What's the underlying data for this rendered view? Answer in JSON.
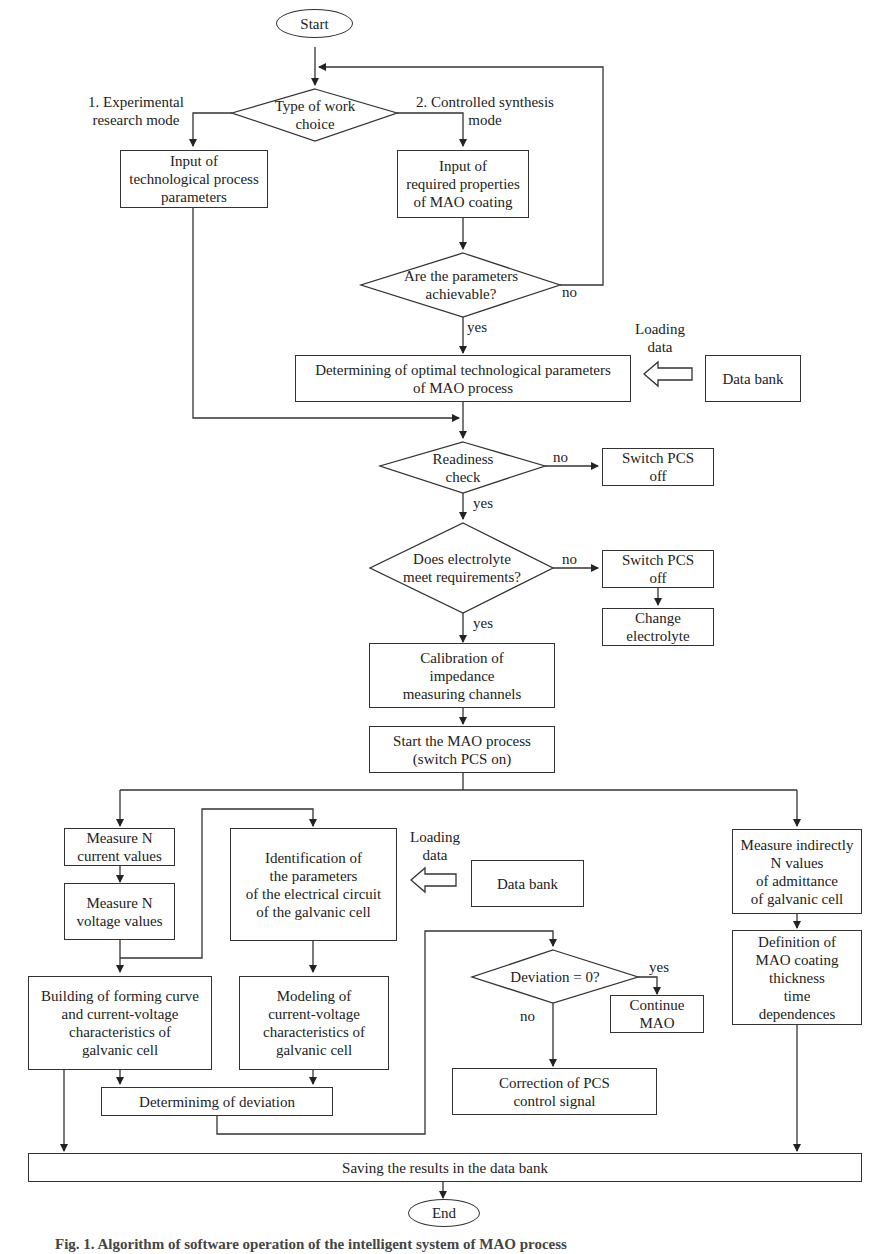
{
  "flowchart": {
    "start": "Start",
    "end": "End",
    "decisions": {
      "work_choice": "Type of work\nchoice",
      "achievable": "Are the parameters\nachievable?",
      "readiness": "Readiness\ncheck",
      "electrolyte": "Does electrolyte\nmeet requirements?",
      "deviation_zero": "Deviation = 0?"
    },
    "processes": {
      "input_tech_params": "Input of\ntechnological process\nparameters",
      "input_required_props": "Input of\nrequired properties\nof MAO coating",
      "determine_optimal": "Determining of optimal technological parameters\nof MAO process",
      "data_bank_1": "Data bank",
      "switch_off_1": "Switch PCS\noff",
      "switch_off_2": "Switch PCS\noff",
      "change_electrolyte": "Change\nelectrolyte",
      "calibration": "Calibration of\nimpedance\nmeasuring channels",
      "start_mao": "Start the MAO process\n(switch PCS on)",
      "measure_current": "Measure N\ncurrent values",
      "measure_voltage": "Measure N\nvoltage values",
      "identification": "Identification of\nthe parameters\nof the electrical circuit\nof the galvanic cell",
      "data_bank_2": "Data bank",
      "measure_admittance": "Measure indirectly\nN values\nof admittance\nof galvanic cell",
      "building_curve": "Building of forming curve\nand current-voltage\ncharacteristics of\ngalvanic cell",
      "modeling": "Modeling of\ncurrent-voltage\ncharacteristics of\ngalvanic cell",
      "definition_thickness": "Definition of\nMAO coating\nthickness\ntime\ndependences",
      "continue_mao": "Continue\nMAO",
      "correction": "Correction of PCS\ncontrol signal",
      "determining_deviation": "Determinimg of deviation",
      "saving": "Saving the results in the data bank"
    },
    "labels": {
      "mode1": "1. Experimental\nresearch mode",
      "mode2": "2. Controlled synthesis\nmode",
      "loading_data_1": "Loading\ndata",
      "loading_data_2": "Loading\ndata",
      "yes_achievable": "yes",
      "no_achievable": "no",
      "no_readiness": "no",
      "yes_readiness": "yes",
      "no_electrolyte": "no",
      "yes_electrolyte": "yes",
      "yes_deviation": "yes",
      "no_deviation": "no"
    }
  },
  "caption": "Fig. 1. Algorithm of software operation of the intelligent system of MAO process"
}
